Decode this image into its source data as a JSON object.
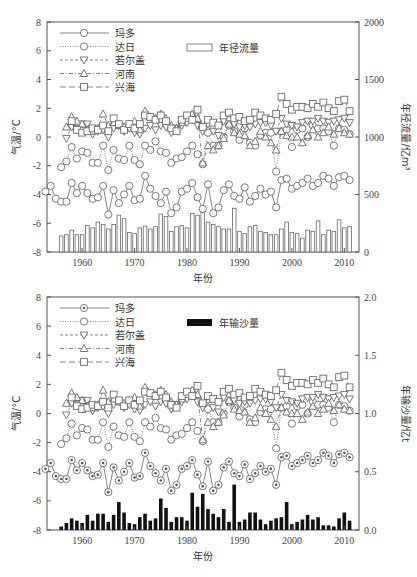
{
  "chart_data": [
    {
      "type": "line+bar",
      "title": "",
      "xlabel": "年份",
      "ylabel": "气温/°C",
      "y2label": "年径流量/亿m³",
      "xlim": [
        1953,
        2012
      ],
      "ylim": [
        -8,
        8
      ],
      "y2lim": [
        0,
        2000
      ],
      "xticks": [
        1960,
        1970,
        1980,
        1990,
        2000,
        2010
      ],
      "yticks": [
        -8,
        -6,
        -4,
        -2,
        0,
        2,
        4,
        6,
        8
      ],
      "y2ticks": [
        0,
        500,
        1000,
        1500,
        2000
      ],
      "legend": [
        "玛多",
        "达日",
        "若尔盖",
        "河南",
        "兴海",
        "年径流量"
      ],
      "bar_series": {
        "name": "年径流量",
        "axis": "y2",
        "style": "hollow",
        "x": [
          1956,
          1957,
          1958,
          1959,
          1960,
          1961,
          1962,
          1963,
          1964,
          1965,
          1966,
          1967,
          1968,
          1969,
          1970,
          1971,
          1972,
          1973,
          1974,
          1975,
          1976,
          1977,
          1978,
          1979,
          1980,
          1981,
          1982,
          1983,
          1984,
          1985,
          1986,
          1987,
          1988,
          1989,
          1990,
          1991,
          1992,
          1993,
          1994,
          1995,
          1996,
          1997,
          1998,
          1999,
          2000,
          2001,
          2002,
          2003,
          2004,
          2005,
          2006,
          2007,
          2008,
          2009,
          2010,
          2011
        ],
        "values": [
          140,
          150,
          190,
          150,
          150,
          230,
          210,
          260,
          240,
          200,
          240,
          320,
          290,
          170,
          160,
          210,
          225,
          200,
          220,
          330,
          310,
          180,
          220,
          230,
          210,
          335,
          320,
          345,
          260,
          240,
          220,
          200,
          200,
          380,
          180,
          160,
          220,
          230,
          180,
          170,
          150,
          150,
          200,
          260,
          170,
          160,
          120,
          190,
          180,
          270,
          150,
          190,
          180,
          280,
          210,
          220
        ]
      },
      "series": [
        {
          "name": "玛多",
          "marker": "circle",
          "line": "solid",
          "x": [
            1953,
            1954,
            1955,
            1956,
            1957,
            1958,
            1959,
            1960,
            1961,
            1962,
            1963,
            1964,
            1965,
            1966,
            1967,
            1968,
            1969,
            1970,
            1971,
            1972,
            1973,
            1974,
            1975,
            1976,
            1977,
            1978,
            1979,
            1980,
            1981,
            1982,
            1983,
            1984,
            1985,
            1986,
            1987,
            1988,
            1989,
            1990,
            1991,
            1992,
            1993,
            1994,
            1995,
            1996,
            1997,
            1998,
            1999,
            2000,
            2001,
            2002,
            2003,
            2004,
            2005,
            2006,
            2007,
            2008,
            2009,
            2010,
            2011
          ],
          "values": [
            -3.8,
            -3.4,
            -4.3,
            -4.5,
            -4.5,
            -3.2,
            -3.9,
            -3.4,
            -3.9,
            -4.3,
            -4.2,
            -3.4,
            -5.4,
            -3.7,
            -4.6,
            -4.0,
            -3.4,
            -4.4,
            -4.3,
            -2.7,
            -3.6,
            -4.1,
            -4.6,
            -3.8,
            -5.3,
            -4.9,
            -3.8,
            -3.6,
            -3.2,
            -4.2,
            -5.0,
            -3.3,
            -5.3,
            -4.9,
            -3.7,
            -3.3,
            -4.1,
            -4.3,
            -3.5,
            -4.5,
            -4.1,
            -3.6,
            -4.0,
            -3.8,
            -4.9,
            -3.0,
            -2.9,
            -3.6,
            -3.4,
            -3.2,
            -2.9,
            -3.4,
            -3.2,
            -2.7,
            -2.9,
            -3.4,
            -2.8,
            -2.7,
            -3.0
          ]
        },
        {
          "name": "达日",
          "marker": "circle",
          "line": "dotted",
          "x": [
            1956,
            1957,
            1958,
            1959,
            1960,
            1961,
            1962,
            1963,
            1964,
            1965,
            1966,
            1967,
            1968,
            1969,
            1970,
            1971,
            1972,
            1973,
            1974,
            1975,
            1976,
            1977,
            1978,
            1979,
            1980,
            1981,
            1982,
            1983,
            1984,
            1985,
            1986,
            1987,
            1988,
            1989,
            1990,
            1991,
            1992,
            1993,
            1994,
            1995,
            1996,
            1997,
            1998,
            1999,
            2000,
            2001,
            2002,
            2003,
            2004,
            2005,
            2006,
            2007,
            2008,
            2009,
            2010,
            2011
          ],
          "values": [
            -2.1,
            -1.7,
            -0.7,
            -1.5,
            -1.0,
            -1.1,
            -1.8,
            -1.8,
            -0.6,
            -2.3,
            -0.9,
            -1.5,
            -1.6,
            -0.6,
            -1.6,
            -1.9,
            -0.6,
            -0.9,
            -0.3,
            -1.0,
            -1.1,
            -1.8,
            -1.5,
            -1.4,
            -1.0,
            -0.6,
            -1.2,
            -1.9,
            0.3,
            -0.6,
            -0.6,
            0.0,
            0.8,
            0.4,
            -0.2,
            0.6,
            -0.4,
            -0.6,
            0.1,
            0.3,
            0.3,
            -2.4,
            0.4,
            0.5,
            -0.7,
            0.5,
            0.6,
            0.0,
            0.8,
            0.6,
            0.6,
            0.4,
            -0.6,
            0.6,
            0.5,
            0.2
          ]
        },
        {
          "name": "若尔盖",
          "marker": "triangle-down",
          "line": "dashed",
          "x": [
            1957,
            1958,
            1959,
            1960,
            1961,
            1962,
            1963,
            1964,
            1965,
            1966,
            1967,
            1968,
            1969,
            1970,
            1971,
            1972,
            1973,
            1974,
            1975,
            1976,
            1977,
            1978,
            1979,
            1980,
            1981,
            1982,
            1983,
            1984,
            1985,
            1986,
            1987,
            1988,
            1989,
            1990,
            1991,
            1992,
            1993,
            1994,
            1995,
            1996,
            1997,
            1998,
            1999,
            2000,
            2001,
            2002,
            2003,
            2004,
            2005,
            2006,
            2007,
            2008,
            2009,
            2010,
            2011
          ],
          "values": [
            -0.1,
            0.7,
            0.6,
            0.9,
            0.9,
            0.2,
            0.4,
            0.5,
            0.0,
            0.6,
            0.8,
            0.4,
            0.6,
            0.3,
            0.2,
            0.6,
            0.8,
            0.5,
            0.8,
            0.7,
            0.3,
            0.6,
            0.8,
            1.0,
            1.2,
            0.8,
            0.4,
            0.9,
            0.4,
            0.1,
            1.1,
            1.2,
            0.9,
            0.7,
            0.8,
            0.7,
            0.9,
            1.0,
            1.0,
            0.8,
            0.4,
            1.3,
            0.9,
            0.8,
            0.7,
            1.0,
            1.1,
            1.1,
            1.3,
            1.1,
            1.0,
            1.1,
            1.2,
            1.3,
            1.0
          ]
        },
        {
          "name": "河南",
          "marker": "triangle-up",
          "line": "dash-dot",
          "x": [
            1957,
            1958,
            1959,
            1960,
            1961,
            1962,
            1963,
            1964,
            1965,
            1966,
            1967,
            1968,
            1969,
            1970,
            1971,
            1972,
            1973,
            1974,
            1975,
            1976,
            1977,
            1978,
            1979,
            1980,
            1981,
            1982,
            1983,
            1984,
            1985,
            1986,
            1987,
            1988,
            1989,
            1990,
            1991,
            1992,
            1993,
            1994,
            1995,
            1996,
            1997,
            1998,
            1999,
            2000,
            2001,
            2002,
            2003,
            2004,
            2005,
            2006,
            2007,
            2008,
            2009,
            2010,
            2011
          ],
          "values": [
            0.7,
            1.4,
            1.1,
            0.9,
            0.5,
            0.4,
            0.6,
            1.6,
            0.8,
            1.0,
            0.8,
            0.7,
            0.9,
            1.1,
            0.5,
            1.8,
            1.4,
            1.3,
            1.6,
            1.3,
            0.8,
            0.6,
            1.0,
            1.3,
            1.6,
            1.3,
            -1.8,
            -0.6,
            -0.9,
            -0.6,
            -0.1,
            0.9,
            0.3,
            0.2,
            0.1,
            -0.6,
            -0.3,
            0.4,
            0.0,
            -0.4,
            -0.9,
            0.4,
            0.1,
            0.0,
            0.0,
            -0.4,
            0.1,
            0.5,
            0.0,
            0.3,
            0.7,
            0.2,
            0.6,
            0.3,
            0.2
          ]
        },
        {
          "name": "兴海",
          "marker": "square",
          "line": "long-dash",
          "x": [
            1958,
            1959,
            1960,
            1961,
            1962,
            1963,
            1964,
            1965,
            1966,
            1967,
            1968,
            1969,
            1970,
            1971,
            1972,
            1973,
            1974,
            1975,
            1976,
            1977,
            1978,
            1979,
            1980,
            1981,
            1982,
            1983,
            1984,
            1985,
            1986,
            1987,
            1988,
            1989,
            1990,
            1991,
            1992,
            1993,
            1994,
            1995,
            1996,
            1997,
            1998,
            1999,
            2000,
            2001,
            2002,
            2003,
            2004,
            2005,
            2006,
            2007,
            2008,
            2009,
            2010,
            2011
          ],
          "values": [
            1.1,
            0.5,
            0.3,
            0.4,
            0.6,
            0.5,
            0.8,
            0.4,
            1.3,
            0.9,
            0.5,
            0.9,
            0.6,
            0.9,
            1.5,
            1.4,
            1.2,
            1.5,
            1.1,
            0.6,
            0.4,
            1.2,
            1.5,
            1.2,
            1.9,
            0.7,
            1.2,
            1.0,
            0.8,
            1.5,
            1.7,
            1.3,
            1.4,
            1.1,
            1.2,
            1.7,
            1.5,
            1.3,
            1.2,
            1.6,
            2.8,
            2.3,
            1.9,
            2.1,
            2.1,
            2.0,
            2.3,
            2.1,
            2.4,
            2.0,
            1.8,
            2.5,
            2.6,
            1.8
          ]
        }
      ]
    },
    {
      "type": "line+bar",
      "title": "",
      "xlabel": "年份",
      "ylabel": "气温/°C",
      "y2label": "年输沙量/亿t",
      "xlim": [
        1953,
        2012
      ],
      "ylim": [
        -8,
        8
      ],
      "y2lim": [
        0.0,
        2.0
      ],
      "xticks": [
        1960,
        1970,
        1980,
        1990,
        2000,
        2010
      ],
      "yticks": [
        -8,
        -6,
        -4,
        -2,
        0,
        2,
        4,
        6,
        8
      ],
      "y2ticks": [
        0.0,
        0.5,
        1.0,
        1.5,
        2.0
      ],
      "legend": [
        "玛多",
        "达日",
        "若尔盖",
        "河南",
        "兴海",
        "年输沙量"
      ],
      "bar_series": {
        "name": "年输沙量",
        "axis": "y2",
        "style": "filled",
        "x": [
          1956,
          1957,
          1958,
          1959,
          1960,
          1961,
          1962,
          1963,
          1964,
          1965,
          1966,
          1967,
          1968,
          1969,
          1970,
          1971,
          1972,
          1973,
          1974,
          1975,
          1976,
          1977,
          1978,
          1979,
          1980,
          1981,
          1982,
          1983,
          1984,
          1985,
          1986,
          1987,
          1988,
          1989,
          1990,
          1991,
          1992,
          1993,
          1994,
          1995,
          1996,
          1997,
          1998,
          1999,
          2000,
          2001,
          2002,
          2003,
          2004,
          2005,
          2006,
          2007,
          2008,
          2009,
          2010,
          2011
        ],
        "values": [
          0.03,
          0.06,
          0.1,
          0.08,
          0.06,
          0.13,
          0.08,
          0.14,
          0.14,
          0.07,
          0.13,
          0.24,
          0.15,
          0.06,
          0.05,
          0.11,
          0.14,
          0.08,
          0.1,
          0.27,
          0.19,
          0.07,
          0.11,
          0.11,
          0.08,
          0.32,
          0.2,
          0.31,
          0.18,
          0.14,
          0.11,
          0.18,
          0.07,
          0.39,
          0.07,
          0.09,
          0.15,
          0.15,
          0.09,
          0.05,
          0.08,
          0.1,
          0.11,
          0.24,
          0.05,
          0.07,
          0.09,
          0.13,
          0.09,
          0.11,
          0.04,
          0.04,
          0.03,
          0.1,
          0.15,
          0.08
        ]
      },
      "series_note": "Same five temperature series as chart 1 (玛多, 达日, 若尔盖, 河南, 兴海); 玛多 uses dotted-center circles."
    }
  ],
  "charts": [
    {
      "id": "top",
      "legend_items": [
        {
          "label": "玛多"
        },
        {
          "label": "达日"
        },
        {
          "label": "若尔盖"
        },
        {
          "label": "河南"
        },
        {
          "label": "兴海"
        }
      ],
      "bar_legend": "年径流量",
      "ylabel": "气温/°C",
      "y2label": "年径流量/亿m³",
      "xlabel": "年份",
      "yticks": [
        "8",
        "6",
        "4",
        "2",
        "0",
        "-2",
        "-4",
        "-6",
        "-8"
      ],
      "y2ticks": [
        "2000",
        "1500",
        "1000",
        "500",
        "0"
      ],
      "xticks": [
        "1960",
        "1970",
        "1980",
        "1990",
        "2000",
        "2010"
      ]
    },
    {
      "id": "bottom",
      "legend_items": [
        {
          "label": "玛多"
        },
        {
          "label": "达日"
        },
        {
          "label": "若尔盖"
        },
        {
          "label": "河南"
        },
        {
          "label": "兴海"
        }
      ],
      "bar_legend": "年输沙量",
      "ylabel": "气温/°C",
      "y2label": "年输沙量/亿t",
      "xlabel": "年份",
      "yticks": [
        "8",
        "6",
        "4",
        "2",
        "0",
        "-2",
        "-4",
        "-6",
        "-8"
      ],
      "y2ticks": [
        "2.0",
        "1.5",
        "1.0",
        "0.5",
        "0.0"
      ],
      "xticks": [
        "1960",
        "1970",
        "1980",
        "1990",
        "2000",
        "2010"
      ]
    }
  ],
  "colors": {
    "axis": "#555555",
    "marker_stroke": "#6a6a6a",
    "bar_hollow_stroke": "#666666",
    "bar_filled": "#111111",
    "text": "#333333"
  }
}
